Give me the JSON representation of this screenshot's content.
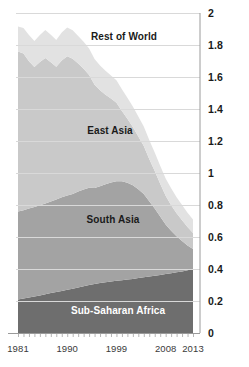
{
  "chart_data": {
    "type": "area",
    "stacked": true,
    "title": "",
    "subtitle": "",
    "xlabel": "",
    "ylabel": "",
    "xlim": [
      1981,
      2013
    ],
    "ylim": [
      0,
      2
    ],
    "grid": true,
    "grid_axis": "y",
    "legend": "inline-labels",
    "x_tick_labels": [
      "1981",
      "1990",
      "1999",
      "2008",
      "2013"
    ],
    "x_tick_values": [
      1981,
      1990,
      1999,
      2008,
      2013
    ],
    "y_tick_labels": [
      "0",
      "0.2",
      "0.4",
      "0.6",
      "0.8",
      "1",
      "1.2",
      "1.4",
      "1.6",
      "1.8",
      "2"
    ],
    "y_tick_values": [
      0,
      0.2,
      0.4,
      0.6,
      0.8,
      1.0,
      1.2,
      1.4,
      1.6,
      1.8,
      2.0
    ],
    "x": [
      1981,
      1982,
      1983,
      1984,
      1985,
      1986,
      1987,
      1988,
      1989,
      1990,
      1991,
      1992,
      1993,
      1994,
      1995,
      1996,
      1997,
      1998,
      1999,
      2000,
      2001,
      2002,
      2003,
      2004,
      2005,
      2006,
      2007,
      2008,
      2009,
      2010,
      2011,
      2012,
      2013
    ],
    "series": [
      {
        "name": "Sub-Saharan Africa",
        "color": "#6e6e6e",
        "label_color": "#ffffff",
        "stack_order": 0,
        "values": [
          0.21,
          0.215,
          0.222,
          0.228,
          0.235,
          0.242,
          0.25,
          0.256,
          0.263,
          0.27,
          0.277,
          0.285,
          0.292,
          0.3,
          0.307,
          0.312,
          0.317,
          0.322,
          0.327,
          0.33,
          0.334,
          0.338,
          0.343,
          0.348,
          0.353,
          0.358,
          0.363,
          0.368,
          0.374,
          0.379,
          0.385,
          0.392,
          0.4
        ]
      },
      {
        "name": "South Asia",
        "color": "#a3a3a3",
        "label_color": "#1a1a1a",
        "stack_order": 1,
        "values": [
          0.55,
          0.552,
          0.556,
          0.56,
          0.563,
          0.567,
          0.572,
          0.578,
          0.585,
          0.59,
          0.592,
          0.6,
          0.605,
          0.608,
          0.6,
          0.605,
          0.612,
          0.618,
          0.622,
          0.618,
          0.605,
          0.585,
          0.555,
          0.52,
          0.47,
          0.42,
          0.365,
          0.31,
          0.265,
          0.225,
          0.19,
          0.155,
          0.125
        ]
      },
      {
        "name": "East Asia",
        "color": "#c9c9c9",
        "label_color": "#1a1a1a",
        "stack_order": 2,
        "values": [
          1.0,
          0.98,
          0.92,
          0.875,
          0.895,
          0.91,
          0.87,
          0.83,
          0.855,
          0.87,
          0.845,
          0.8,
          0.755,
          0.705,
          0.645,
          0.6,
          0.56,
          0.525,
          0.49,
          0.44,
          0.4,
          0.365,
          0.33,
          0.3,
          0.265,
          0.235,
          0.205,
          0.18,
          0.16,
          0.145,
          0.13,
          0.115,
          0.1
        ]
      },
      {
        "name": "Rest of World",
        "color": "#e2e2e2",
        "label_color": "#1a1a1a",
        "stack_order": 3,
        "values": [
          0.155,
          0.16,
          0.165,
          0.162,
          0.17,
          0.175,
          0.172,
          0.168,
          0.175,
          0.18,
          0.178,
          0.172,
          0.168,
          0.165,
          0.16,
          0.155,
          0.15,
          0.145,
          0.14,
          0.135,
          0.132,
          0.128,
          0.125,
          0.122,
          0.118,
          0.115,
          0.112,
          0.108,
          0.105,
          0.1,
          0.095,
          0.09,
          0.085
        ]
      }
    ],
    "series_label_positions": [
      {
        "name": "Rest of World",
        "x_px": 124,
        "y_px": 36
      },
      {
        "name": "East Asia",
        "x_px": 110,
        "y_px": 130
      },
      {
        "name": "South Asia",
        "x_px": 113,
        "y_px": 219
      },
      {
        "name": "Sub-Saharan Africa",
        "x_px": 118,
        "y_px": 310
      }
    ],
    "axis_geometry": {
      "plot_left_px": 18,
      "plot_right_px": 193,
      "y_zero_px": 333,
      "y_max_px": 13
    },
    "colors": {
      "gridline": "#d9d9d9",
      "axis_line": "#9a9a9a",
      "tick_text": "#1a1a1a",
      "background": "#ffffff"
    }
  },
  "top_caption": ""
}
